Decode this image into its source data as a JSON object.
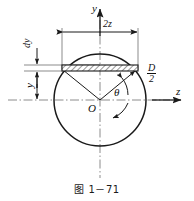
{
  "figure": {
    "caption": "图 1－71",
    "colors": {
      "stroke": "#1a1a1a",
      "thin": "#555555",
      "centerline": "#7a7a7a",
      "hatch": "#333333",
      "background": "#ffffff"
    },
    "labels": {
      "y_axis": "y",
      "z_axis": "z",
      "width_2z": "2z",
      "strip_thickness": "dy",
      "height_y": "y",
      "angle_theta": "θ",
      "origin": "O",
      "radius_numerator": "D",
      "radius_denominator": "2"
    },
    "geometry": {
      "circle_center_x": 100,
      "circle_center_y": 100,
      "circle_radius": 46,
      "strip_y": 68,
      "strip_height": 6,
      "strip_left_x": 62,
      "strip_right_x": 138,
      "dimension_line_y": 32,
      "vertical_dim_x": 37
    }
  }
}
